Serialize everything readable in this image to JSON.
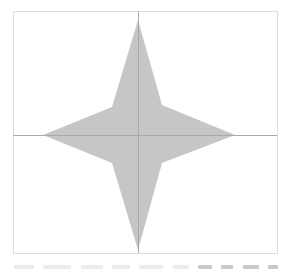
{
  "figure": {
    "shape": "four-pointed-star",
    "colors": {
      "background": "#ffffff",
      "frame_stroke": "#dedede",
      "axis_stroke": "#a9a9a9",
      "star_fill": "#c6c6c6",
      "caption_light": "#ececec",
      "caption_dark": "#c9c9c9"
    },
    "frame": {
      "x": 13,
      "y": 11,
      "width": 264,
      "height": 242
    },
    "axes": {
      "vertical_x": 138,
      "horizontal_y": 135
    },
    "star_points": "138,20 162,105 235,135 162,163 138,250 112,163 43,135 112,107",
    "caption": {
      "legible": false,
      "segments": [
        {
          "width": 20,
          "tone": "light"
        },
        {
          "width": 28,
          "tone": "light"
        },
        {
          "width": 22,
          "tone": "light"
        },
        {
          "width": 18,
          "tone": "light"
        },
        {
          "width": 24,
          "tone": "light"
        },
        {
          "width": 16,
          "tone": "light"
        },
        {
          "width": 14,
          "tone": "dark"
        },
        {
          "width": 12,
          "tone": "dark"
        },
        {
          "width": 16,
          "tone": "dark"
        },
        {
          "width": 10,
          "tone": "dark"
        }
      ]
    }
  }
}
